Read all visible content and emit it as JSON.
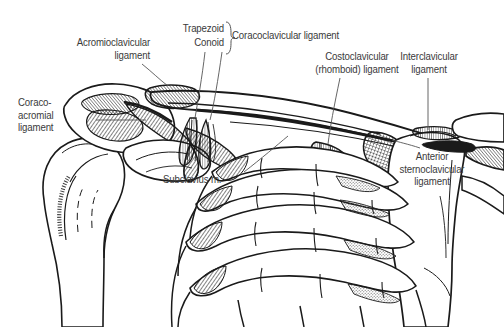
{
  "figure": {
    "style": "line-art medical illustration, black ink on white",
    "background_color": "#ffffff",
    "ink_color": "#1a1a1a",
    "label_color": "#3a3a3a"
  },
  "labels": {
    "acromioclavicular": "Acromioclavicular\nligament",
    "coracoacromial": "Coraco-\nacromial\nligament",
    "trapezoid": "Trapezoid",
    "conoid": "Conoid",
    "coracoclavicular": "Coracoclavicular ligament",
    "costoclavicular": "Costoclavicular\n(rhomboid) ligament",
    "interclavicular": "Interclavicular\nligament",
    "anterior_sternoclavicular": "Anterior\nsternoclavicular\nligament",
    "subclavius": "Subclavius m."
  },
  "structures": [
    {
      "name": "humerus-head",
      "label": ""
    },
    {
      "name": "scapula-acromion",
      "label": ""
    },
    {
      "name": "coracoid-process",
      "label": ""
    },
    {
      "name": "clavicle",
      "label": ""
    },
    {
      "name": "manubrium-sternum",
      "label": ""
    },
    {
      "name": "first-rib",
      "label": ""
    },
    {
      "name": "second-rib",
      "label": ""
    },
    {
      "name": "third-rib",
      "label": ""
    },
    {
      "name": "fourth-rib",
      "label": ""
    }
  ]
}
